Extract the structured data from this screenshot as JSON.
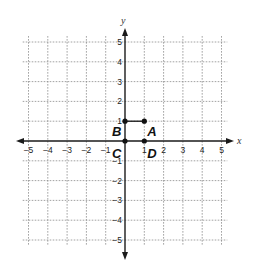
{
  "chart_data": {
    "type": "scatter",
    "title": "",
    "xlabel": "x",
    "ylabel": "y",
    "xlim": [
      -5,
      5
    ],
    "ylim": [
      -5,
      5
    ],
    "grid": true,
    "x_ticks": [
      -5,
      -4,
      -3,
      -2,
      -1,
      1,
      2,
      3,
      4,
      5
    ],
    "y_ticks": [
      -5,
      -4,
      -3,
      -2,
      -1,
      1,
      2,
      3,
      4,
      5
    ],
    "points": [
      {
        "label": "A",
        "x": 1,
        "y": 1
      },
      {
        "label": "B",
        "x": 0,
        "y": 1
      },
      {
        "label": "C",
        "x": 0,
        "y": 0
      },
      {
        "label": "D",
        "x": 1,
        "y": 0
      }
    ],
    "segments": [
      {
        "from": "B",
        "to": "A"
      }
    ]
  },
  "axes": {
    "x_name": "x",
    "y_name": "y"
  },
  "colors": {
    "axis": "#1a1a1a",
    "grid": "#8a8a8a",
    "point": "#111111"
  }
}
